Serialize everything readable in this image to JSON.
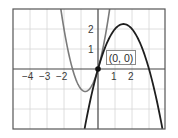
{
  "chart_data": {
    "type": "line",
    "title": "",
    "xlabel": "",
    "ylabel": "",
    "xlim": [
      -5,
      4
    ],
    "ylim": [
      -3,
      3
    ],
    "grid": true,
    "x_ticks": [
      -4,
      -3,
      -2,
      1,
      2
    ],
    "x_tick_labels": [
      "−4",
      "−3",
      "−2",
      "1",
      "2"
    ],
    "y_ticks": [
      1,
      2
    ],
    "y_tick_labels": [
      "1",
      "2"
    ],
    "series": [
      {
        "name": "parabola-opening-up",
        "equation": "y = 2x^2 + 3x",
        "color": "#7a7a7a",
        "x": [
          -2.19,
          -2.0,
          -1.5,
          -1.0,
          -0.75,
          -0.5,
          0.0,
          0.5,
          0.69
        ],
        "y": [
          3.0,
          2.0,
          0.0,
          -1.0,
          -1.125,
          -1.0,
          0.0,
          2.0,
          3.0
        ]
      },
      {
        "name": "parabola-opening-down",
        "equation": "y = 3x - x^2",
        "color": "#1e1e1e",
        "x": [
          -0.79,
          -0.5,
          0.0,
          0.5,
          1.0,
          1.5,
          2.0,
          2.5,
          3.0,
          3.5,
          3.79
        ],
        "y": [
          -3.0,
          -1.75,
          0.0,
          1.25,
          2.0,
          2.25,
          2.0,
          1.25,
          0.0,
          -1.75,
          -3.0
        ]
      }
    ],
    "annotations": [
      {
        "text": "(0, 0)",
        "x": 0,
        "y": 0,
        "marker": "point"
      }
    ]
  },
  "labels": {
    "point": "(0, 0)",
    "xticks": [
      "−4",
      "−3",
      "−2",
      "1",
      "2"
    ],
    "yticks": [
      "2",
      "1"
    ]
  }
}
